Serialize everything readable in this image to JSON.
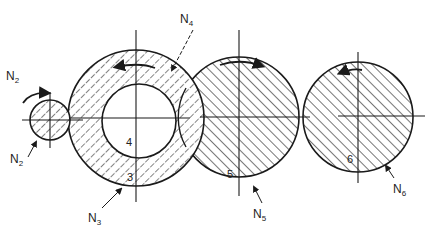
{
  "diagram": {
    "type": "gear-train cross-section",
    "background": "#ffffff",
    "ink_color": "#1a1a1a",
    "center_line_y": 117,
    "bodies": [
      {
        "id": "2",
        "label": "",
        "cx": 50,
        "cy": 120,
        "r": 20,
        "hatch": "forward"
      },
      {
        "id": "3",
        "label": "3",
        "cx": 136,
        "cy": 118,
        "r": 68,
        "hatch": "forward",
        "bore_r": 37,
        "bore_cx": 139,
        "bore_cy": 121
      },
      {
        "id": "4",
        "label": "4",
        "cx": 139,
        "cy": 121,
        "r": 37,
        "hatch": "none"
      },
      {
        "id": "5",
        "label": "5",
        "cx": 239,
        "cy": 117,
        "r": 60,
        "hatch": "back"
      },
      {
        "id": "6",
        "label": "6",
        "cx": 358,
        "cy": 117,
        "r": 55,
        "hatch": "back"
      }
    ],
    "annotations": [
      {
        "id": "n2-top",
        "base": "N",
        "sub": "2",
        "x": 6,
        "y": 80
      },
      {
        "id": "n2-bottom",
        "base": "N",
        "sub": "2",
        "x": 10,
        "y": 163
      },
      {
        "id": "n3",
        "base": "N",
        "sub": "3",
        "x": 88,
        "y": 222
      },
      {
        "id": "n4",
        "base": "N",
        "sub": "4",
        "x": 180,
        "y": 23
      },
      {
        "id": "n5",
        "base": "N",
        "sub": "5",
        "x": 253,
        "y": 218
      },
      {
        "id": "n6",
        "base": "N",
        "sub": "6",
        "x": 393,
        "y": 193
      }
    ],
    "body_numbers": [
      {
        "text": "3",
        "x": 127,
        "y": 181
      },
      {
        "text": "4",
        "x": 126,
        "y": 146
      },
      {
        "text": "5",
        "x": 227,
        "y": 178
      },
      {
        "text": "6",
        "x": 347,
        "y": 163
      }
    ],
    "rotation_arrows": [
      {
        "id": "arrow-2",
        "direction": "clockwise"
      },
      {
        "id": "arrow-3",
        "direction": "counter-clockwise"
      },
      {
        "id": "arrow-5",
        "direction": "clockwise"
      },
      {
        "id": "arrow-6",
        "direction": "counter-clockwise"
      }
    ]
  }
}
